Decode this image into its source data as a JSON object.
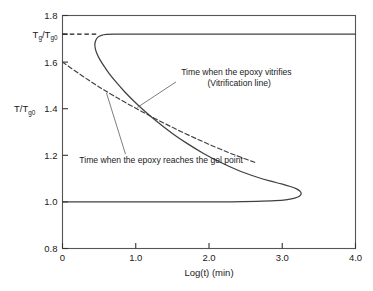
{
  "chart_data": {
    "type": "line",
    "title": "",
    "xlabel": "Log(t)  (min)",
    "ylabel": "T/T",
    "ylabel_sub": "g0",
    "xlim": [
      0,
      4.0
    ],
    "ylim": [
      0.8,
      1.8
    ],
    "grid": false,
    "legend_position": "none",
    "xticks": [
      0,
      1.0,
      2.0,
      3.0,
      4.0
    ],
    "xtick_labels": [
      "0",
      "1.0",
      "2.0",
      "3.0",
      "4.0"
    ],
    "yticks": [
      0.8,
      1.0,
      1.2,
      1.4,
      1.6,
      1.8
    ],
    "ytick_labels": [
      "0.8",
      "1.0",
      "1.2",
      "1.4",
      "1.6",
      "1.8"
    ],
    "special_ytick": {
      "value": 1.72,
      "label_main": "T",
      "label_sub1": "g",
      "label_mid": "/T",
      "label_sub2": "g0"
    },
    "series": [
      {
        "name": "Vitrification line",
        "style": "solid",
        "color": "#404040",
        "points": [
          [
            4.0,
            1.72
          ],
          [
            3.2,
            1.72
          ],
          [
            2.4,
            1.72
          ],
          [
            1.6,
            1.72
          ],
          [
            1.0,
            1.72
          ],
          [
            0.72,
            1.72
          ],
          [
            0.6,
            1.719
          ],
          [
            0.53,
            1.715
          ],
          [
            0.48,
            1.706
          ],
          [
            0.452,
            1.692
          ],
          [
            0.442,
            1.676
          ],
          [
            0.448,
            1.658
          ],
          [
            0.468,
            1.638
          ],
          [
            0.505,
            1.614
          ],
          [
            0.56,
            1.586
          ],
          [
            0.635,
            1.552
          ],
          [
            0.73,
            1.515
          ],
          [
            0.845,
            1.474
          ],
          [
            0.98,
            1.431
          ],
          [
            1.135,
            1.386
          ],
          [
            1.31,
            1.34
          ],
          [
            1.5,
            1.294
          ],
          [
            1.705,
            1.25
          ],
          [
            1.925,
            1.208
          ],
          [
            2.155,
            1.17
          ],
          [
            2.395,
            1.136
          ],
          [
            2.64,
            1.108
          ],
          [
            2.83,
            1.09
          ],
          [
            2.99,
            1.077
          ],
          [
            3.11,
            1.066
          ],
          [
            3.195,
            1.056
          ],
          [
            3.245,
            1.045
          ],
          [
            3.258,
            1.034
          ],
          [
            3.232,
            1.024
          ],
          [
            3.17,
            1.016
          ],
          [
            3.07,
            1.01
          ],
          [
            2.9,
            1.005
          ],
          [
            2.65,
            1.002
          ],
          [
            2.3,
            1.0
          ],
          [
            1.8,
            1.0
          ],
          [
            1.2,
            1.0
          ],
          [
            0.6,
            1.0
          ],
          [
            0.0,
            1.0
          ]
        ]
      },
      {
        "name": "Gelation line",
        "style": "dashed",
        "color": "#404040",
        "points": [
          [
            0.0,
            1.6
          ],
          [
            0.35,
            1.524
          ],
          [
            0.7,
            1.455
          ],
          [
            1.1,
            1.385
          ],
          [
            1.5,
            1.32
          ],
          [
            1.9,
            1.261
          ],
          [
            2.25,
            1.214
          ],
          [
            2.5,
            1.184
          ],
          [
            2.65,
            1.167
          ]
        ]
      }
    ],
    "asymptote_dashed": {
      "name": "Tg-infinity dashed leader",
      "y": 1.72,
      "x_from": 0.0,
      "x_to": 0.46,
      "style": "dashed",
      "color": "#1a1a1a"
    },
    "annotations": [
      {
        "name": "vitrification-annotation",
        "lines": [
          "Time when the epoxy vitrifies",
          "(Vitrification line)"
        ],
        "text_x": 1.62,
        "text_y": 1.545,
        "leader_from": [
          1.55,
          1.515
        ],
        "leader_to": [
          1.02,
          1.405
        ]
      },
      {
        "name": "gel-point-annotation",
        "lines": [
          "Time when the epoxy reaches the gel point"
        ],
        "text_x": 0.23,
        "text_y": 1.168,
        "leader_from": [
          0.86,
          1.205
        ],
        "leader_to": [
          0.6,
          1.468
        ]
      }
    ]
  }
}
